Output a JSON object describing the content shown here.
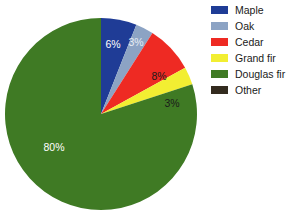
{
  "chart_data": {
    "type": "pie",
    "title": "",
    "categories": [
      "Maple",
      "Oak",
      "Cedar",
      "Grand fir",
      "Douglas fir",
      "Other"
    ],
    "values": [
      6,
      3,
      8,
      3,
      80,
      0
    ],
    "value_labels": [
      "6%",
      "3%",
      "8%",
      "3%",
      "80%",
      ""
    ],
    "colors": [
      "#1f3c96",
      "#8ca3c4",
      "#ee2a23",
      "#f2ee32",
      "#3f7a24",
      "#332b1f"
    ],
    "label_text_colors": [
      "#ffffff",
      "#ffffff",
      "#1a1a1a",
      "#1a1a1a",
      "#ffffff",
      "#ffffff"
    ],
    "start_angle_deg": 0,
    "direction": "clockwise",
    "legend_position": "right",
    "grid": false,
    "units": "percent",
    "background": "#ffffff"
  },
  "legend": {
    "items": [
      {
        "label": "Maple",
        "color": "#1f3c96"
      },
      {
        "label": "Oak",
        "color": "#8ca3c4"
      },
      {
        "label": "Cedar",
        "color": "#ee2a23"
      },
      {
        "label": "Grand fir",
        "color": "#f2ee32"
      },
      {
        "label": "Douglas fir",
        "color": "#3f7a24"
      },
      {
        "label": "Other",
        "color": "#332b1f"
      }
    ]
  },
  "slice_labels": [
    {
      "text": "6%",
      "x": 113,
      "y": 45,
      "color": "#ffffff"
    },
    {
      "text": "3%",
      "x": 136,
      "y": 43,
      "color": "#e8eef5"
    },
    {
      "text": "8%",
      "x": 159,
      "y": 77,
      "color": "#1a1a1a"
    },
    {
      "text": "3%",
      "x": 172,
      "y": 104,
      "color": "#1a1a1a"
    },
    {
      "text": "80%",
      "x": 54,
      "y": 148,
      "color": "#ffffff"
    }
  ],
  "geometry": {
    "cx": 101,
    "cy": 114,
    "r": 96
  }
}
